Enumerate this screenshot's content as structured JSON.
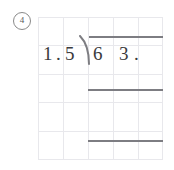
{
  "problem": {
    "number_label": "4",
    "marker_shape": "circle"
  },
  "division": {
    "divisor": {
      "digit_1": "1",
      "decimal_point": ".",
      "digit_2": "5",
      "text": "1.5"
    },
    "dividend": {
      "digit_1": "6",
      "digit_2": "3",
      "decimal_point": ".",
      "text": "63."
    },
    "bracket_icon": "long-division-bracket-icon",
    "vinculum_icon": "division-overbar-icon",
    "work_rules": 2
  },
  "grid": {
    "columns": 5,
    "rows": 5,
    "cell_width": 25,
    "cell_height": 28,
    "line_color": "#e8e8ec"
  },
  "colors": {
    "ink": "#3a3a3c",
    "rule": "#7d7d82",
    "marker": "#5a5a5a",
    "background": "#ffffff"
  }
}
